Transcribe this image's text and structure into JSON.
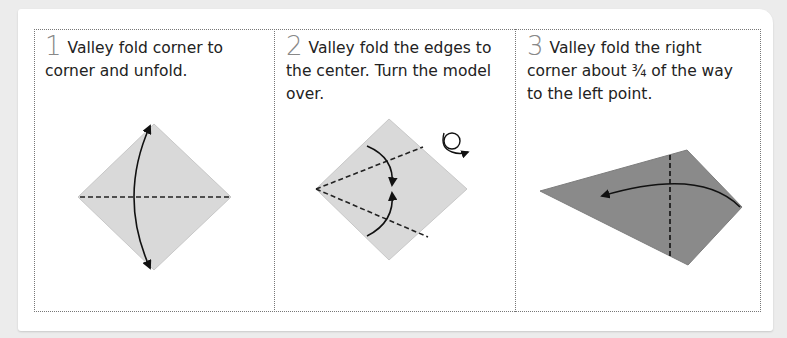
{
  "steps": [
    {
      "number": "1",
      "text": "Valley fold corner to corner and unfold.",
      "illustration": "square-diamond-with-horizontal-valley-fold-and-double-arrow"
    },
    {
      "number": "2",
      "text": "Valley fold the edges to the center. Turn the model over.",
      "illustration": "square-diamond-with-two-valley-folds-to-center-and-turn-over-symbol"
    },
    {
      "number": "3",
      "text": "Valley fold the right corner about ¾ of the way to the left point.",
      "illustration": "kite-shape-with-vertical-valley-fold-and-arrow-left"
    }
  ],
  "colors": {
    "background": "#ececec",
    "paper": "#ffffff",
    "paper_model_light": "#d9d9d9",
    "paper_model_dark": "#8a8a8a",
    "step_number": "#888888",
    "text": "#222222"
  }
}
